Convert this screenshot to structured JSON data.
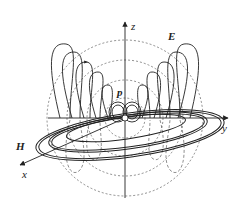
{
  "diagram": {
    "labels": {
      "z": "z",
      "y": "y",
      "x": "x",
      "E": "E",
      "H": "H",
      "p": "p"
    },
    "colors": {
      "line": "#222222",
      "dashed": "#444444",
      "background": "#ffffff"
    }
  }
}
